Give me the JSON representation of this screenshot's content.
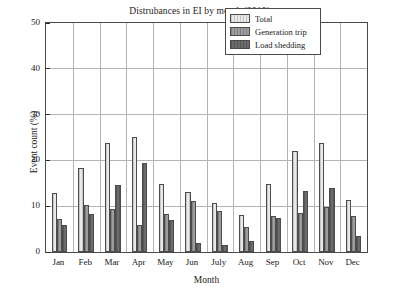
{
  "chart_data": {
    "type": "bar",
    "title": "Distrubances in EI by month (2010)",
    "xlabel": "Month",
    "ylabel": "Event count (%)",
    "categories": [
      "Jan",
      "Feb",
      "Mar",
      "Apr",
      "May",
      "Jun",
      "July",
      "Aug",
      "Sep",
      "Oct",
      "Nov",
      "Dec"
    ],
    "series": [
      {
        "name": "Total",
        "color": "#e9e9e9",
        "values": [
          12.8,
          18.3,
          23.7,
          25.1,
          14.8,
          13.0,
          10.7,
          8.1,
          14.9,
          22.1,
          23.7,
          11.3
        ]
      },
      {
        "name": "Generation trip",
        "color": "#9d9d9d",
        "values": [
          7.1,
          10.2,
          9.4,
          5.9,
          8.3,
          11.2,
          9.0,
          5.5,
          7.8,
          8.6,
          9.8,
          7.8
        ]
      },
      {
        "name": "Load shedding",
        "color": "#6b6b6b",
        "values": [
          6.0,
          8.2,
          14.6,
          19.4,
          7.0,
          1.9,
          1.6,
          2.5,
          7.5,
          13.4,
          14.0,
          3.4
        ]
      }
    ],
    "ylim": [
      0,
      50
    ],
    "yticks": [
      0,
      10,
      20,
      30,
      40,
      50
    ],
    "ytick_labels": [
      "0",
      "10",
      "20",
      "30",
      "40",
      "50"
    ],
    "grid": true,
    "legend_position": "upper right"
  }
}
